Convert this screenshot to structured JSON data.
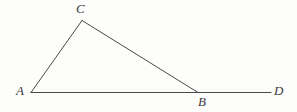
{
  "figure": {
    "kind": "geometry-diagram",
    "background_color": "#fdfdfc",
    "stroke_color": "#4a4a4a",
    "label_color": "#3a3a3a",
    "stroke_width": 1,
    "canvas": {
      "width": 297,
      "height": 112
    },
    "points": {
      "A": {
        "x": 31,
        "y": 92.5
      },
      "B": {
        "x": 198,
        "y": 92.5
      },
      "C": {
        "x": 82,
        "y": 20.5
      },
      "D": {
        "x": 271,
        "y": 92.5
      }
    },
    "segments": [
      {
        "name": "segment-AD",
        "from": "A",
        "to": "D"
      },
      {
        "name": "segment-AC",
        "from": "A",
        "to": "C"
      },
      {
        "name": "segment-CB",
        "from": "C",
        "to": "B"
      }
    ],
    "labels": [
      {
        "name": "label-A",
        "text": "A",
        "x": 16,
        "y": 84,
        "anchor": "left"
      },
      {
        "name": "label-B",
        "text": "B",
        "x": 198,
        "y": 95,
        "anchor": "left"
      },
      {
        "name": "label-C",
        "text": "C",
        "x": 76,
        "y": 2,
        "anchor": "left"
      },
      {
        "name": "label-D",
        "text": "D",
        "x": 274,
        "y": 84,
        "anchor": "left"
      }
    ]
  }
}
